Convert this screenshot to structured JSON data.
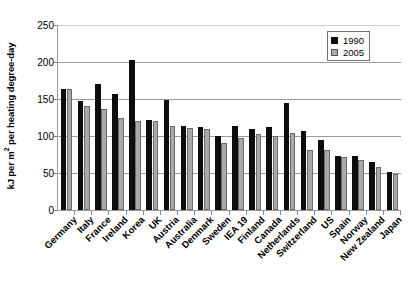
{
  "chart_data": {
    "type": "bar",
    "title": "",
    "xlabel": "",
    "ylabel": "kJ per m² per heating degree-day",
    "ylabel_prefix": "kJ per m",
    "ylabel_sup": "2",
    "ylabel_suffix": " per heating degree-day",
    "ylim": [
      0,
      250
    ],
    "ytick_values": [
      0,
      50,
      100,
      150,
      200,
      250
    ],
    "ytick_labels": [
      "0",
      "50",
      "100",
      "150",
      "200",
      "250"
    ],
    "grid": true,
    "grid_axis": "y",
    "legend_position": "top-right",
    "categories": [
      "Germany",
      "Italy",
      "France",
      "Ireland",
      "Korea",
      "UK",
      "Austria",
      "Australia",
      "Denmark",
      "Sweden",
      "IEA 19",
      "Finland",
      "Canada",
      "Netherlands",
      "Switzerland",
      "US",
      "Spain",
      "Norway",
      "New Zealand",
      "Japan"
    ],
    "series": [
      {
        "name": "1990",
        "color": "#0d0d0d",
        "values": [
          164,
          147,
          170,
          157,
          203,
          122,
          148,
          113,
          112,
          100,
          113,
          110,
          112,
          145,
          107,
          95,
          73,
          73,
          65,
          51
        ]
      },
      {
        "name": "2005",
        "color": "#a9a9a9",
        "values": [
          163,
          140,
          137,
          124,
          120,
          120,
          114,
          111,
          110,
          91,
          97,
          103,
          100,
          104,
          81,
          81,
          71,
          67,
          58,
          49
        ]
      }
    ]
  },
  "legend": {
    "items": [
      {
        "label": "1990",
        "swatch": "black-square-swatch"
      },
      {
        "label": "2005",
        "swatch": "gray-square-swatch"
      }
    ]
  },
  "axis": {
    "y_title": "kJ per m² per heating degree-day"
  }
}
